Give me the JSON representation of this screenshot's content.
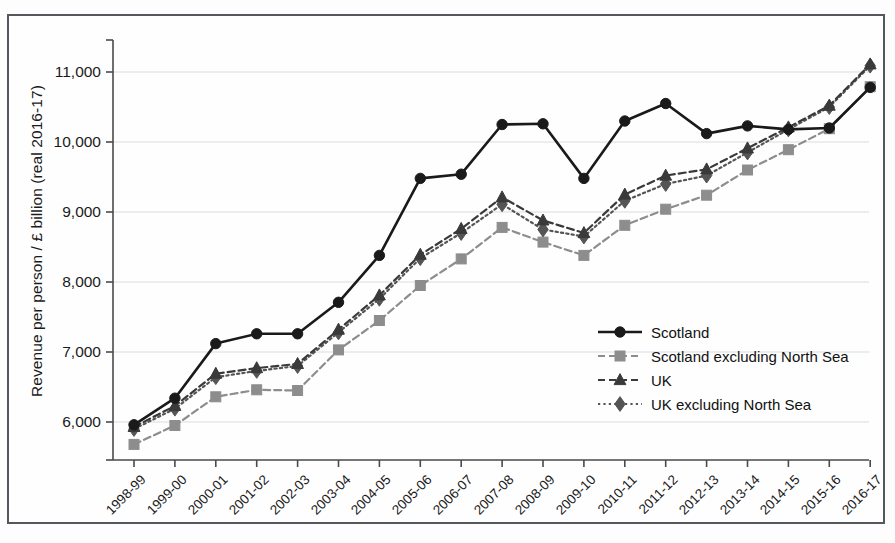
{
  "chart_data": {
    "type": "line",
    "title": "",
    "xlabel": "",
    "ylabel": "Revenue per person / £ billion (real 2016-17)",
    "ylim": [
      5600,
      11400
    ],
    "yticks": [
      6000,
      7000,
      8000,
      9000,
      10000,
      11000
    ],
    "ytick_labels": [
      "6,000",
      "7,000",
      "8,000",
      "9,000",
      "10,000",
      "11,000"
    ],
    "grid": true,
    "legend_position": "inside-right",
    "categories": [
      "1998-99",
      "1999-00",
      "2000-01",
      "2001-02",
      "2002-03",
      "2003-04",
      "2004-05",
      "2005-06",
      "2006-07",
      "2007-08",
      "2008-09",
      "2009-10",
      "2010-11",
      "2011-12",
      "2012-13",
      "2013-14",
      "2014-15",
      "2015-16",
      "2016-17"
    ],
    "series": [
      {
        "name": "Scotland",
        "marker": "circle",
        "line_style": "solid",
        "color": "#1a1a1a",
        "values": [
          5960,
          6340,
          7120,
          7260,
          7260,
          7710,
          8380,
          9480,
          9540,
          10250,
          10260,
          9480,
          10300,
          10550,
          10120,
          10230,
          10180,
          10200,
          10780
        ]
      },
      {
        "name": "Scotland excluding North Sea",
        "marker": "square",
        "line_style": "dashed",
        "color": "#8d8d8d",
        "values": [
          5680,
          5950,
          6360,
          6460,
          6450,
          7030,
          7450,
          7950,
          8330,
          8780,
          8570,
          8380,
          8810,
          9040,
          9240,
          9600,
          9890,
          10190,
          10790
        ]
      },
      {
        "name": "UK",
        "marker": "triangle",
        "line_style": "dashed",
        "color": "#3a3a3a",
        "values": [
          5930,
          6230,
          6690,
          6770,
          6830,
          7320,
          7810,
          8390,
          8760,
          9210,
          8880,
          8700,
          9250,
          9520,
          9610,
          9910,
          10210,
          10520,
          11110
        ]
      },
      {
        "name": "UK excluding North Sea",
        "marker": "diamond",
        "line_style": "dotted",
        "color": "#555555",
        "values": [
          5900,
          6190,
          6640,
          6730,
          6800,
          7280,
          7760,
          8340,
          8700,
          9110,
          8750,
          8650,
          9160,
          9400,
          9520,
          9850,
          10180,
          10500,
          11090
        ]
      }
    ]
  }
}
